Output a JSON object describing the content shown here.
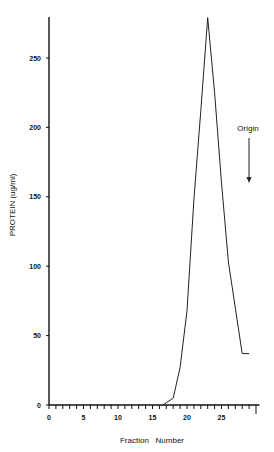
{
  "chart_data": {
    "type": "line",
    "title": "",
    "xlabel": "Fraction   Number",
    "ylabel": "PROTEIN (ug/ml)",
    "xlim": [
      0,
      30
    ],
    "ylim": [
      0,
      280
    ],
    "xticks": [
      0,
      5,
      10,
      15,
      20,
      25
    ],
    "yticks": [
      0,
      50,
      100,
      150,
      200,
      250
    ],
    "grid": false,
    "legend": null,
    "x": [
      16.5,
      18,
      19,
      20,
      21,
      22,
      23,
      24,
      25,
      26,
      27,
      28,
      29
    ],
    "series": [
      {
        "name": "Protein",
        "values": [
          0,
          5,
          27,
          68,
          148,
          212,
          279,
          225,
          160,
          103,
          70,
          37,
          37
        ]
      }
    ],
    "annotations": [
      {
        "text": "Origin",
        "type": "arrow-down",
        "x": 29
      }
    ]
  }
}
